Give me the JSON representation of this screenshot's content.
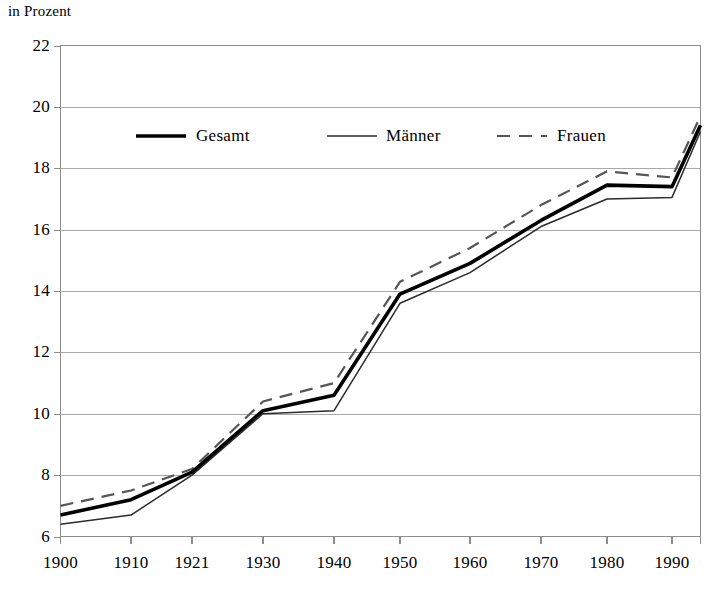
{
  "chart_data": {
    "type": "line",
    "title": "",
    "ylabel": "in Prozent",
    "xlabel": "",
    "ylim": [
      6,
      22
    ],
    "ytick_labels": [
      "22",
      "20",
      "18",
      "16",
      "14",
      "12",
      "10",
      "8",
      "6"
    ],
    "ytick_values": [
      22,
      20,
      18,
      16,
      14,
      12,
      10,
      8,
      6
    ],
    "grid": true,
    "legend_position": "upper-left-inside",
    "categories": [
      "1900",
      "1910",
      "1921",
      "1930",
      "1940",
      "1950",
      "1960",
      "1970",
      "1980",
      "1990",
      ""
    ],
    "xtick_labels": [
      "1900",
      "1910",
      "1921",
      "1930",
      "1940",
      "1950",
      "1960",
      "1970",
      "1980",
      "1990"
    ],
    "series": [
      {
        "name": "Gesamt",
        "style": "solid-thick",
        "color": "#000000",
        "values": [
          6.7,
          7.2,
          8.1,
          10.1,
          10.6,
          13.9,
          14.9,
          16.3,
          17.45,
          17.4,
          19.4
        ]
      },
      {
        "name": "Männer",
        "style": "solid-thin",
        "color": "#2b2b2b",
        "values": [
          6.4,
          6.7,
          8.0,
          10.0,
          10.1,
          13.6,
          14.6,
          16.1,
          17.0,
          17.05,
          19.2
        ]
      },
      {
        "name": "Frauen",
        "style": "dashed",
        "color": "#555555",
        "values": [
          7.0,
          7.5,
          8.2,
          10.4,
          11.0,
          14.3,
          15.4,
          16.8,
          17.9,
          17.7,
          19.7
        ]
      }
    ]
  },
  "legend": {
    "items": [
      {
        "label": "Gesamt"
      },
      {
        "label": "Männer"
      },
      {
        "label": "Frauen"
      }
    ]
  }
}
